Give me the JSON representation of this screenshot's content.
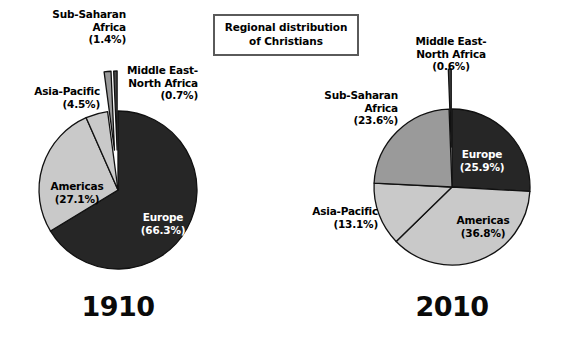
{
  "title": {
    "line1": "Regional distribution",
    "line2": "of Christians"
  },
  "colors": {
    "europe": "#262626",
    "americas": "#c9c9c9",
    "asia_pacific": "#c9c9c9",
    "sub_saharan_africa": "#9a9a9a",
    "middle_east_north_africa": "#4a4a4a",
    "outline": "#111111",
    "box_border": "#5a5a5a",
    "background": "#ffffff"
  },
  "charts": [
    {
      "year": "1910",
      "labels": {
        "europe": {
          "name": "Europe",
          "pct": "(66.3%)"
        },
        "americas": {
          "name": "Americas",
          "pct": "(27.1%)"
        },
        "asia_pacific": {
          "name": "Asia-Pacific",
          "pct": "(4.5%)"
        },
        "sub_saharan_africa": {
          "name_line1": "Sub-Saharan",
          "name_line2": "Africa",
          "pct": "(1.4%)"
        },
        "middle_east_north_africa": {
          "name_line1": "Middle East-",
          "name_line2": "North Africa",
          "pct": "(0.7%)"
        }
      }
    },
    {
      "year": "2010",
      "labels": {
        "europe": {
          "name": "Europe",
          "pct": "(25.9%)"
        },
        "americas": {
          "name": "Americas",
          "pct": "(36.8%)"
        },
        "asia_pacific": {
          "name": "Asia-Pacific",
          "pct": "(13.1%)"
        },
        "sub_saharan_africa": {
          "name_line1": "Sub-Saharan",
          "name_line2": "Africa",
          "pct": "(23.6%)"
        },
        "middle_east_north_africa": {
          "name_line1": "Middle East-",
          "name_line2": "North Africa",
          "pct": "(0.6%)"
        }
      }
    }
  ],
  "chart_data": [
    {
      "type": "pie",
      "title": "Regional distribution of Christians",
      "subtitle": "1910",
      "categories": [
        "Europe",
        "Americas",
        "Asia-Pacific",
        "Sub-Saharan Africa",
        "Middle East-North Africa"
      ],
      "values": [
        66.3,
        27.1,
        4.5,
        1.4,
        0.7
      ],
      "unit": "percent",
      "labels": [
        "(66.3%)",
        "(27.1%)",
        "(4.5%)",
        "(1.4%)",
        "(0.7%)"
      ],
      "colors": [
        "#262626",
        "#c9c9c9",
        "#c9c9c9",
        "#9a9a9a",
        "#4a4a4a"
      ],
      "exploded": [
        false,
        false,
        false,
        true,
        true
      ],
      "start_angle_deg": 0,
      "direction": "clockwise",
      "legend": "none",
      "grid": false
    },
    {
      "type": "pie",
      "title": "Regional distribution of Christians",
      "subtitle": "2010",
      "categories": [
        "Europe",
        "Americas",
        "Asia-Pacific",
        "Sub-Saharan Africa",
        "Middle East-North Africa"
      ],
      "values": [
        25.9,
        36.8,
        13.1,
        23.6,
        0.6
      ],
      "unit": "percent",
      "labels": [
        "(25.9%)",
        "(36.8%)",
        "(13.1%)",
        "(23.6%)",
        "(0.6%)"
      ],
      "colors": [
        "#262626",
        "#c9c9c9",
        "#c9c9c9",
        "#9a9a9a",
        "#4a4a4a"
      ],
      "exploded": [
        false,
        false,
        false,
        false,
        true
      ],
      "start_angle_deg": 0,
      "direction": "clockwise",
      "legend": "none",
      "grid": false
    }
  ]
}
